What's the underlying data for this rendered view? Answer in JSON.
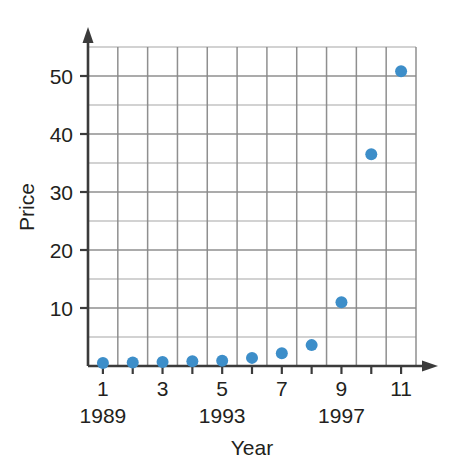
{
  "chart_data": {
    "type": "scatter",
    "title": "",
    "xlabel": "Year",
    "ylabel": "Price",
    "x": [
      1,
      2,
      3,
      4,
      5,
      6,
      7,
      8,
      9,
      10,
      11
    ],
    "values": [
      0.5,
      0.6,
      0.7,
      0.8,
      0.9,
      1.4,
      2.2,
      3.6,
      11.0,
      36.5,
      50.8
    ],
    "xlim": [
      0.5,
      11.5
    ],
    "ylim": [
      0,
      55
    ],
    "x_tick_labels": [
      "1",
      "3",
      "5",
      "7",
      "9",
      "11"
    ],
    "x_tick_values": [
      1,
      3,
      5,
      7,
      9,
      11
    ],
    "y_tick_labels": [
      "10",
      "20",
      "30",
      "40",
      "50"
    ],
    "y_tick_values": [
      10,
      20,
      30,
      40,
      50
    ],
    "x_secondary_labels": [
      "1989",
      "1993",
      "1997"
    ],
    "x_secondary_values": [
      1,
      5,
      9
    ],
    "grid": true,
    "grid_x_step": 1,
    "grid_y_step": 5,
    "legend": false,
    "legend_position": "none",
    "marker_color": "#3d8ec9",
    "grid_color": "#8a8a8a",
    "axis_color": "#3b3b3b",
    "marker_size": 9,
    "annotations": []
  },
  "axis_titles": {
    "x": "Year",
    "y": "Price"
  }
}
